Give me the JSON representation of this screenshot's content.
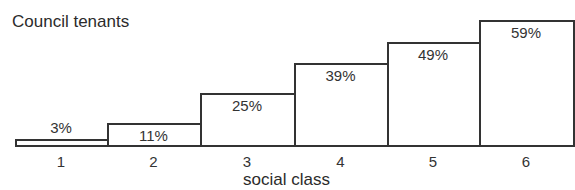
{
  "chart_data": {
    "type": "bar",
    "title": "Council tenants",
    "xlabel": "social class",
    "ylabel": "",
    "categories": [
      "1",
      "2",
      "3",
      "4",
      "5",
      "6"
    ],
    "values": [
      3,
      11,
      25,
      39,
      49,
      59
    ],
    "value_labels": [
      "3%",
      "11%",
      "25%",
      "39%",
      "49%",
      "59%"
    ],
    "unit": "%",
    "ylim": [
      0,
      60
    ],
    "grid": false,
    "legend": null
  },
  "bar_color": "#ffffff",
  "edge_color": "#333333"
}
